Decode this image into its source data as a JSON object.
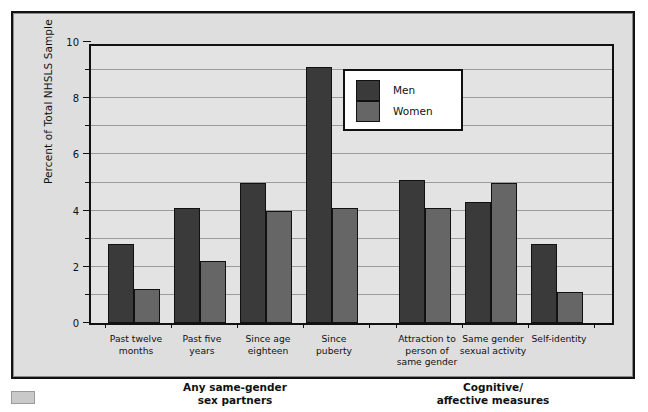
{
  "chart_data": {
    "type": "bar",
    "title": "",
    "xlabel": "",
    "ylabel": "Percent of Total NHSLS Sample",
    "ylim": [
      0,
      10
    ],
    "ytick_labels": [
      "0",
      "2",
      "4",
      "6",
      "8",
      "10"
    ],
    "ytick_values": [
      0,
      2,
      4,
      6,
      8,
      10
    ],
    "gridlines": [
      1,
      2,
      3,
      4,
      5,
      6,
      7,
      8,
      9,
      10
    ],
    "grid": true,
    "legend_position": "upper-center",
    "categories": [
      "Past twelve\nmonths",
      "Past five\nyears",
      "Since age\neighteen",
      "Since\npuberty",
      "Attraction to\nperson of\nsame gender",
      "Same gender\nsexual activity",
      "Self-identity"
    ],
    "series": [
      {
        "name": "Men",
        "color": "#3a3a3a",
        "values": [
          2.8,
          4.1,
          5.0,
          9.1,
          5.1,
          4.3,
          2.8
        ]
      },
      {
        "name": "Women",
        "color": "#666666",
        "values": [
          1.2,
          2.2,
          4.0,
          4.1,
          4.1,
          5.0,
          1.1
        ]
      }
    ],
    "groups": [
      {
        "label": "Any same-gender\nsex partners",
        "categories": [
          0,
          1,
          2,
          3
        ]
      },
      {
        "label": "Cognitive/\naffective measures",
        "categories": [
          4,
          5,
          6
        ]
      }
    ]
  },
  "legend": {
    "items": [
      {
        "label": "Men",
        "color": "#3a3a3a"
      },
      {
        "label": "Women",
        "color": "#666666"
      }
    ]
  },
  "colors": {
    "men": "#3a3a3a",
    "women": "#666666",
    "plot_background": "#e3e3e3",
    "figure_background": "#dedede",
    "axis": "#111111",
    "gridline": "#9b9b9b"
  }
}
